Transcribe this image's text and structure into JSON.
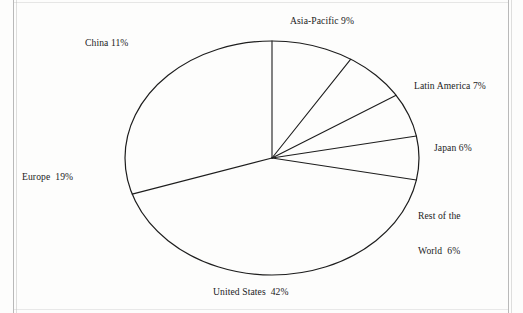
{
  "page": {
    "background_color": "#fdfdfc",
    "ink_color": "#1d1d1d"
  },
  "chart_data": {
    "type": "pie",
    "title": "",
    "subtitle": "",
    "xlabel": "",
    "ylabel": "",
    "legend_position": "outside-labels",
    "grid": false,
    "units": "percent",
    "center": {
      "x": 272,
      "y": 158
    },
    "radius": {
      "rx": 147,
      "ry": 117
    },
    "start_angle_deg": -90,
    "direction": "clockwise",
    "total": 100,
    "categories": [
      "Asia-Pacific",
      "Latin America",
      "Japan",
      "Rest of the World",
      "United States",
      "Europe",
      "China"
    ],
    "values": [
      9,
      7,
      6,
      6,
      42,
      19,
      11
    ],
    "slices": [
      {
        "name": "Asia-Pacific",
        "value": 9,
        "label": "Asia-Pacific 9%",
        "label_lines": [
          "Asia-Pacific 9%"
        ],
        "fill": "none",
        "stroke": "#1d1d1d"
      },
      {
        "name": "Latin America",
        "value": 7,
        "label": "Latin America 7%",
        "label_lines": [
          "Latin America 7%"
        ],
        "fill": "none",
        "stroke": "#1d1d1d"
      },
      {
        "name": "Japan",
        "value": 6,
        "label": "Japan 6%",
        "label_lines": [
          "Japan 6%"
        ],
        "fill": "none",
        "stroke": "#1d1d1d"
      },
      {
        "name": "Rest of the World",
        "value": 6,
        "label": "Rest of the World  6%",
        "label_lines": [
          "Rest of the",
          "World  6%"
        ],
        "fill": "none",
        "stroke": "#1d1d1d"
      },
      {
        "name": "United States",
        "value": 42,
        "label": "United States  42%",
        "label_lines": [
          "United States  42%"
        ],
        "fill": "none",
        "stroke": "#1d1d1d"
      },
      {
        "name": "Europe",
        "value": 19,
        "label": "Europe  19%",
        "label_lines": [
          "Europe  19%"
        ],
        "fill": "none",
        "stroke": "#1d1d1d"
      },
      {
        "name": "China",
        "value": 11,
        "label": "China 11%",
        "label_lines": [
          "China 11%"
        ],
        "fill": "none",
        "stroke": "#1d1d1d"
      }
    ]
  },
  "labels": {
    "asia_pacific": "Asia-Pacific 9%",
    "china": "China 11%",
    "latin_america": "Latin America 7%",
    "japan": "Japan 6%",
    "rest_of_world_line1": "Rest of the",
    "rest_of_world_line2": "World  6%",
    "europe": "Europe  19%",
    "united_states": "United States  42%"
  }
}
